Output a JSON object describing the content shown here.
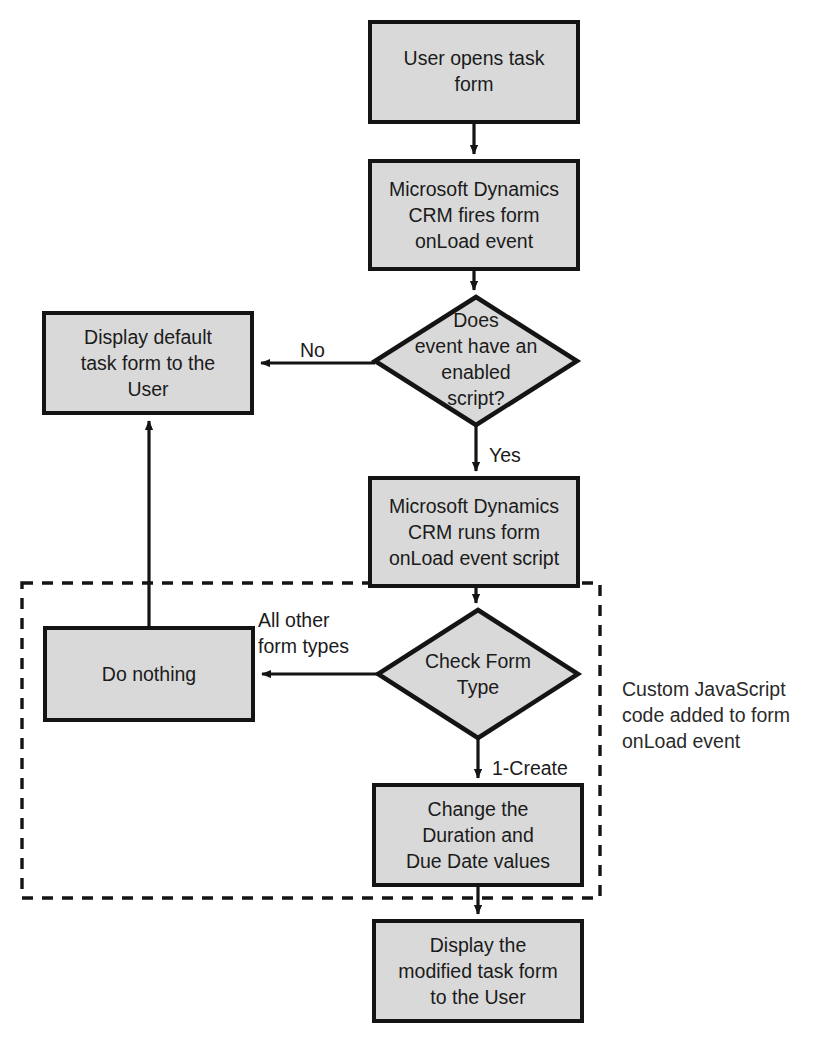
{
  "diagram": {
    "colors": {
      "node_fill": "#d9d9d9",
      "node_stroke": "#141414",
      "connector": "#141414",
      "text": "#1b1b1b",
      "background": "#ffffff"
    },
    "nodes": [
      {
        "id": "start",
        "type": "process",
        "lines": [
          "User opens task",
          "form"
        ],
        "x": 370,
        "y": 22,
        "w": 208,
        "h": 100
      },
      {
        "id": "fires-onload",
        "type": "process",
        "lines": [
          "Microsoft Dynamics",
          "CRM fires form",
          "onLoad event"
        ],
        "x": 370,
        "y": 161,
        "w": 208,
        "h": 108
      },
      {
        "id": "has-enabled-script",
        "type": "decision",
        "lines": [
          "Does",
          "event have an",
          "enabled",
          "script?"
        ],
        "cx": 476,
        "cy": 361,
        "rx": 101,
        "ry": 64
      },
      {
        "id": "display-default",
        "type": "process",
        "lines": [
          "Display default",
          "task form to the",
          "User"
        ],
        "x": 44,
        "y": 313,
        "w": 208,
        "h": 100
      },
      {
        "id": "runs-script",
        "type": "process",
        "lines": [
          "Microsoft Dynamics",
          "CRM runs form",
          "onLoad event script"
        ],
        "x": 370,
        "y": 478,
        "w": 208,
        "h": 108
      },
      {
        "id": "check-form-type",
        "type": "decision",
        "lines": [
          "Check Form",
          "Type"
        ],
        "cx": 478,
        "cy": 674,
        "rx": 100,
        "ry": 64
      },
      {
        "id": "do-nothing",
        "type": "process",
        "lines": [
          "Do nothing"
        ],
        "x": 45,
        "y": 628,
        "w": 208,
        "h": 92
      },
      {
        "id": "change-values",
        "type": "process",
        "lines": [
          "Change the",
          "Duration and",
          "Due Date values"
        ],
        "x": 374,
        "y": 785,
        "w": 208,
        "h": 100
      },
      {
        "id": "display-modified",
        "type": "process",
        "lines": [
          "Display the",
          "modified task form",
          "to the User"
        ],
        "x": 374,
        "y": 921,
        "w": 208,
        "h": 100
      }
    ],
    "edge_labels": [
      {
        "id": "no",
        "text": "No",
        "x": 300,
        "y": 350
      },
      {
        "id": "yes",
        "text": "Yes",
        "x": 489,
        "y": 455
      },
      {
        "id": "all-other-form-types",
        "line1": "All other",
        "line2": "form types",
        "x": 258,
        "y": 630
      },
      {
        "id": "one-create",
        "text": "1-Create",
        "x": 492,
        "y": 768
      }
    ],
    "group": {
      "id": "custom-js-group",
      "x": 22,
      "y": 583,
      "w": 578,
      "h": 315,
      "annotation": [
        "Custom JavaScript",
        "code added to form",
        "onLoad event"
      ],
      "annotation_x": 622,
      "annotation_y": 696
    }
  }
}
